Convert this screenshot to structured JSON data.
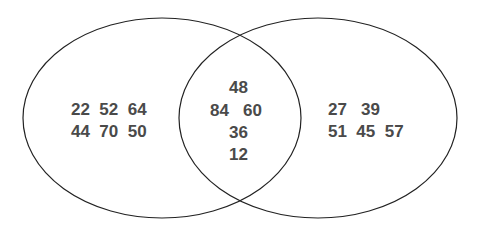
{
  "venn": {
    "left_set": {
      "row1": "22  52  64",
      "row2": "44  70  50",
      "values": [
        22,
        52,
        64,
        44,
        70,
        50
      ]
    },
    "intersection": {
      "top": "48",
      "middle": "84   60",
      "row3": "36",
      "row4": "12",
      "values": [
        48,
        84,
        60,
        36,
        12
      ]
    },
    "right_set": {
      "row1": "27   39",
      "row2": "51  45  57",
      "values": [
        27,
        39,
        51,
        45,
        57
      ]
    },
    "colors": {
      "stroke": "#222222",
      "text": "#4a4a4a",
      "background": "#ffffff"
    }
  }
}
